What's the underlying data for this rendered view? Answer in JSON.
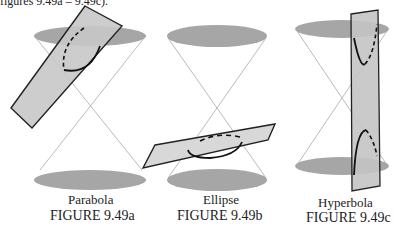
{
  "header": {
    "fragment": "figures 9.49a – 9.49c)."
  },
  "figures": [
    {
      "label": "Parabola",
      "caption": "FIGURE 9.49a"
    },
    {
      "label": "Ellipse",
      "caption": "FIGURE 9.49b"
    },
    {
      "label": "Hyperbola",
      "caption": "FIGURE 9.49c"
    }
  ],
  "colors": {
    "cone_base": "#a6a6a6",
    "plane_fill": "#c8c8c8",
    "plane_stroke": "#222222",
    "cone_line": "#9a9a9a",
    "curve": "#111111"
  }
}
